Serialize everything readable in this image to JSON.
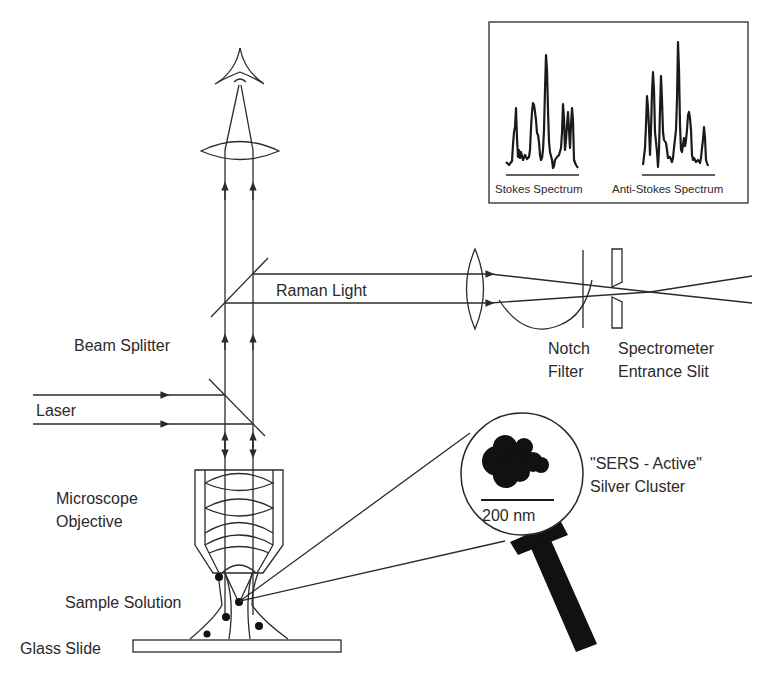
{
  "diagram": {
    "type": "SERS micro-Raman experimental setup",
    "labels": {
      "raman_light": "Raman Light",
      "beam_splitter": "Beam Splitter",
      "laser": "Laser",
      "microscope_objective_line1": "Microscope",
      "microscope_objective_line2": "Objective",
      "sample_solution": "Sample Solution",
      "glass_slide": "Glass Slide",
      "notch_filter_line1": "Notch",
      "notch_filter_line2": "Filter",
      "spectrometer_line1": "Spectrometer",
      "spectrometer_line2": "Entrance Slit",
      "sers_cluster_line1": "\"SERS - Active\"",
      "sers_cluster_line2": "Silver Cluster",
      "scale_bar": "200 nm"
    },
    "inset": {
      "stokes_label": "Stokes Spectrum",
      "anti_stokes_label": "Anti-Stokes Spectrum"
    },
    "colors": {
      "line": "#2a2a2a",
      "fill": "#111111",
      "background": "#ffffff"
    }
  }
}
